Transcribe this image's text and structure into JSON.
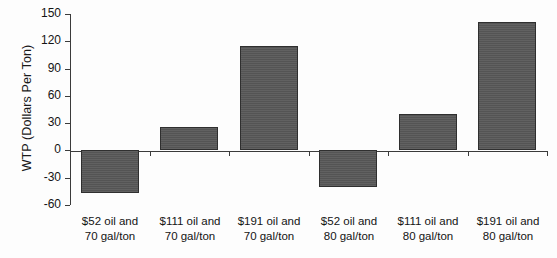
{
  "chart_data": {
    "type": "bar",
    "title": "",
    "xlabel": "",
    "ylabel": "WTP (Dollars Per Ton)",
    "categories": [
      "$52 oil and\n70 gal/ton",
      "$111 oil and\n70 gal/ton",
      "$191 oil and\n70 gal/ton",
      "$52 oil and\n80 gal/ton",
      "$111 oil and\n80 gal/ton",
      "$191 oil and\n80 gal/ton"
    ],
    "category_lines": [
      [
        "$52 oil and",
        "70 gal/ton"
      ],
      [
        "$111 oil and",
        "70 gal/ton"
      ],
      [
        "$191 oil and",
        "70 gal/ton"
      ],
      [
        "$52 oil and",
        "80 gal/ton"
      ],
      [
        "$111 oil and",
        "80 gal/ton"
      ],
      [
        "$191 oil and",
        "80 gal/ton"
      ]
    ],
    "values": [
      -47,
      26,
      115,
      -40,
      40,
      141
    ],
    "ylim": [
      -60,
      150
    ],
    "ytick_labels": [
      "150",
      "120",
      "90",
      "60",
      "30",
      "0",
      "-30",
      "-60"
    ],
    "ytick_values": [
      150,
      120,
      90,
      60,
      30,
      0,
      -30,
      -60
    ],
    "grid": false,
    "legend": null,
    "bar_color": "#585858",
    "axis_color": "#3b3b3b"
  }
}
